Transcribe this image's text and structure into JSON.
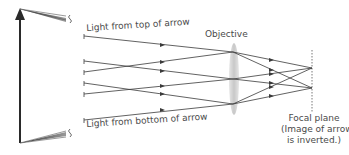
{
  "labels": {
    "top_light": "Light from top of arrow",
    "bottom_light": "Light from bottom of arrow",
    "objective": "Objective",
    "focal_plane_lines": [
      "Focal plane",
      "(Image of arrow",
      "is inverted.)"
    ]
  },
  "colors": {
    "line": "#3a3a3a",
    "text": "#4a4a4a",
    "lens": "#cfcfcf",
    "background": "#ffffff"
  }
}
